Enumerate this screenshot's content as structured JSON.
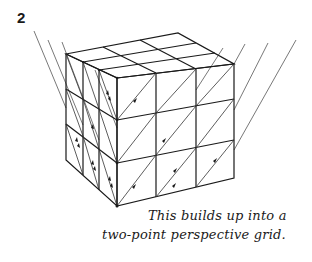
{
  "figure": {
    "step_number": "2",
    "caption_lines": [
      "This builds up into a",
      "two-point perspective grid."
    ],
    "colors": {
      "ink": "#1a1a1a",
      "guide": "#555555",
      "background": "#ffffff"
    }
  }
}
